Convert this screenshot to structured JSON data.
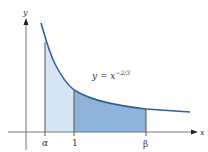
{
  "figure": {
    "axes": {
      "x_label": "x",
      "y_label": "y"
    },
    "curve_label": {
      "prefix": "y = x",
      "exponent": "−2/3"
    },
    "ticks": {
      "alpha": "α",
      "one": "1",
      "beta": "β"
    },
    "colors": {
      "curve": "#2f5f9e",
      "region_light": "#d6e5f2",
      "region_dark": "#8fb3d9",
      "axis": "#555555"
    }
  }
}
